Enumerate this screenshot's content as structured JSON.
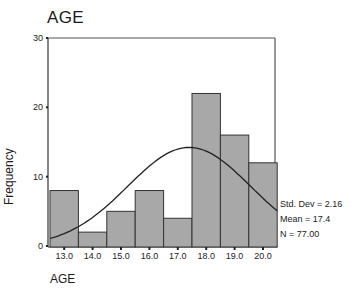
{
  "chart_data": {
    "type": "bar",
    "subtype": "histogram",
    "title": "AGE",
    "xlabel": "AGE",
    "ylabel": "Frequency",
    "categories": [
      "13.0",
      "14.0",
      "15.0",
      "16.0",
      "17.0",
      "18.0",
      "19.0",
      "20.0"
    ],
    "values": [
      8,
      2,
      5,
      8,
      4,
      22,
      16,
      12
    ],
    "ylim": [
      0,
      30
    ],
    "yticks": [
      0,
      10,
      20,
      30
    ],
    "grid": false,
    "normal_curve": {
      "shown": true,
      "mean": 17.4,
      "std_dev": 2.16,
      "n": 77
    },
    "annotations": [
      "Std. Dev = 2.16",
      "Mean = 17.4",
      "N = 77.00"
    ],
    "colors": {
      "bar_fill": "#a8a8a8",
      "bar_stroke": "#333333",
      "curve": "#222222",
      "frame": "#555555"
    }
  },
  "title": "AGE",
  "xlabel": "AGE",
  "ylabel": "Frequency",
  "stats": {
    "std_dev": "Std. Dev = 2.16",
    "mean": "Mean = 17.4",
    "n": "N = 77.00"
  },
  "yticks": [
    "0",
    "10",
    "20",
    "30"
  ]
}
